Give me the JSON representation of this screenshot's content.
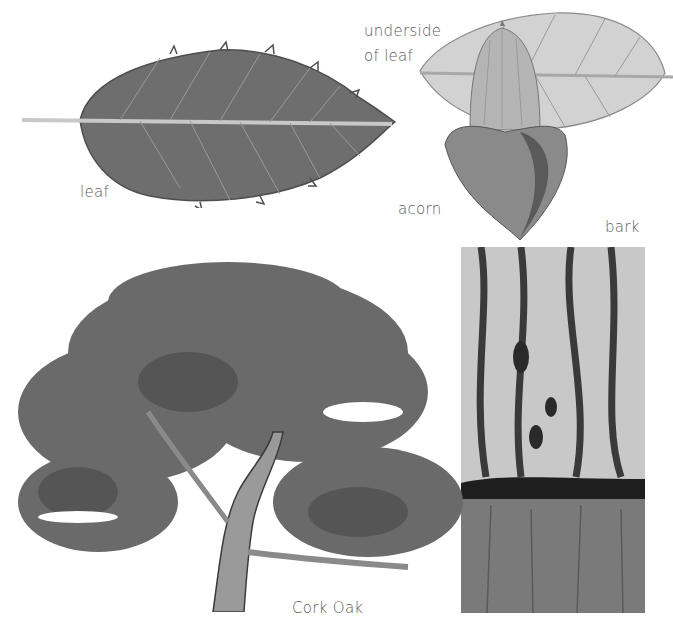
{
  "page": {
    "background": "#ffffff",
    "ink_color": "#5a5a5a"
  },
  "illustrations": {
    "leaf": {
      "label": "leaf",
      "fill": "#6e6e6e"
    },
    "underside_leaf": {
      "label_line1": "underside",
      "label_line2": "of leaf",
      "fill": "#d2d2d2"
    },
    "acorn": {
      "label": "acorn",
      "nut_fill": "#b4b4b4",
      "cup_fill": "#8a8a8a"
    },
    "bark": {
      "label": "bark",
      "upper_fill": "#c8c8c8",
      "lower_fill": "#7a7a7a"
    },
    "tree": {
      "caption": "Cork Oak",
      "foliage_fill": "#6a6a6a",
      "trunk_fill": "#9a9a9a"
    }
  }
}
